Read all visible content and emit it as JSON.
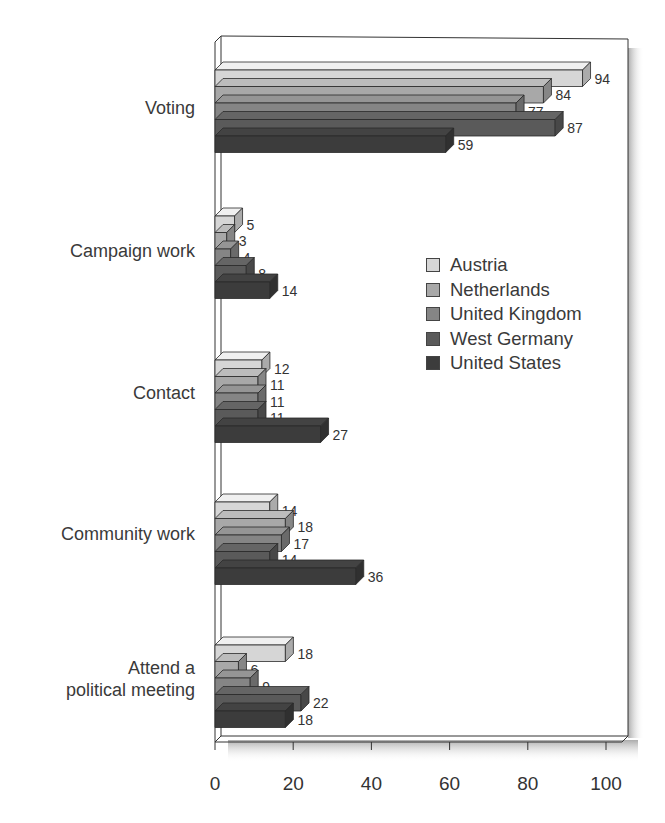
{
  "chart_data": {
    "type": "bar",
    "orientation": "horizontal",
    "style": "3d",
    "title": "",
    "xlabel": "",
    "ylabel": "",
    "xlim": [
      0,
      100
    ],
    "x_ticks": [
      0,
      20,
      40,
      60,
      80,
      100
    ],
    "grid": false,
    "legend_position": "right-center (inside plot)",
    "categories": [
      "Voting",
      "Campaign work",
      "Contact",
      "Community work",
      "Attend a\npolitical meeting"
    ],
    "series": [
      {
        "name": "Austria",
        "color": "#d6d6d6",
        "values": [
          94,
          5,
          12,
          14,
          18
        ]
      },
      {
        "name": "Netherlands",
        "color": "#a8a8a8",
        "values": [
          84,
          3,
          11,
          18,
          6
        ]
      },
      {
        "name": "United Kingdom",
        "color": "#858585",
        "values": [
          77,
          4,
          11,
          17,
          9
        ]
      },
      {
        "name": "West Germany",
        "color": "#5a5a5a",
        "values": [
          87,
          8,
          11,
          14,
          22
        ]
      },
      {
        "name": "United States",
        "color": "#3c3c3c",
        "values": [
          59,
          14,
          27,
          36,
          18
        ]
      }
    ]
  },
  "legend": {
    "items": [
      {
        "label": "Austria",
        "color": "#d6d6d6"
      },
      {
        "label": "Netherlands",
        "color": "#a8a8a8"
      },
      {
        "label": "United Kingdom",
        "color": "#858585"
      },
      {
        "label": "West Germany",
        "color": "#5a5a5a"
      },
      {
        "label": "United States",
        "color": "#3c3c3c"
      }
    ]
  },
  "axis": {
    "tick_labels": [
      "0",
      "20",
      "40",
      "60",
      "80",
      "100"
    ]
  },
  "categories": {
    "voting": "Voting",
    "campaign_work": "Campaign work",
    "contact": "Contact",
    "community_work": "Community work",
    "attend_meeting": "Attend a\npolitical meeting"
  }
}
